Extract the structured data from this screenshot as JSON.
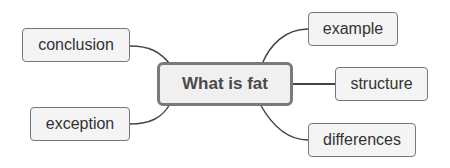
{
  "mindmap": {
    "central": {
      "label": "What is fat"
    },
    "branches": [
      {
        "label": "conclusion",
        "side": "left"
      },
      {
        "label": "exception",
        "side": "left"
      },
      {
        "label": "example",
        "side": "right"
      },
      {
        "label": "structure",
        "side": "right"
      },
      {
        "label": "differences",
        "side": "right"
      }
    ]
  },
  "colors": {
    "node_fill": "#f4f4f4",
    "node_border": "#777777",
    "central_border": "#7a7a7a",
    "line": "#444444",
    "text": "#333333"
  }
}
